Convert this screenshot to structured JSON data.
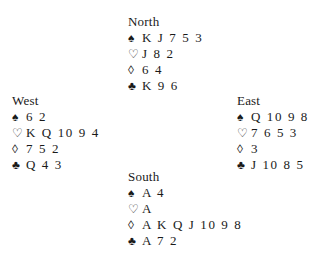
{
  "hands": {
    "north": {
      "title": "North",
      "spades": "K J 7 5 3",
      "hearts": "J 8 2",
      "diamonds": "6 4",
      "clubs": "K 9 6"
    },
    "west": {
      "title": "West",
      "spades": "6 2",
      "hearts": "K Q 10 9 4",
      "diamonds": "7 5 2",
      "clubs": "Q 4 3"
    },
    "east": {
      "title": "East",
      "spades": "Q 10 9 8",
      "hearts": "7 6 5 3",
      "diamonds": "3",
      "clubs": "J 10 8 5"
    },
    "south": {
      "title": "South",
      "spades": "A 4",
      "hearts": "A",
      "diamonds": "A K Q J 10 9 8",
      "clubs": "A 7 2"
    }
  },
  "suit_symbols": {
    "spades": "♠",
    "hearts": "♡",
    "diamonds": "◊",
    "clubs": "♣"
  }
}
